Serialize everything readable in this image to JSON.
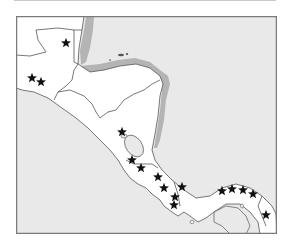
{
  "map": {
    "title": "",
    "region": "Central America",
    "colors": {
      "sea": "#e9e9e9",
      "land": "#ffffff",
      "shelf": "#b4b4b4",
      "border": "#555555",
      "frame": "#7a7a7a",
      "marker": "#111111"
    },
    "marker_symbol": "★",
    "markers": [
      {
        "x": 66,
        "y": 43
      },
      {
        "x": 32,
        "y": 78
      },
      {
        "x": 41,
        "y": 82
      },
      {
        "x": 122,
        "y": 132
      },
      {
        "x": 132,
        "y": 160
      },
      {
        "x": 141,
        "y": 168
      },
      {
        "x": 158,
        "y": 177
      },
      {
        "x": 164,
        "y": 188
      },
      {
        "x": 182,
        "y": 187
      },
      {
        "x": 175,
        "y": 197
      },
      {
        "x": 174,
        "y": 205
      },
      {
        "x": 222,
        "y": 191
      },
      {
        "x": 232,
        "y": 189
      },
      {
        "x": 243,
        "y": 190
      },
      {
        "x": 253,
        "y": 194
      },
      {
        "x": 266,
        "y": 215
      }
    ]
  }
}
